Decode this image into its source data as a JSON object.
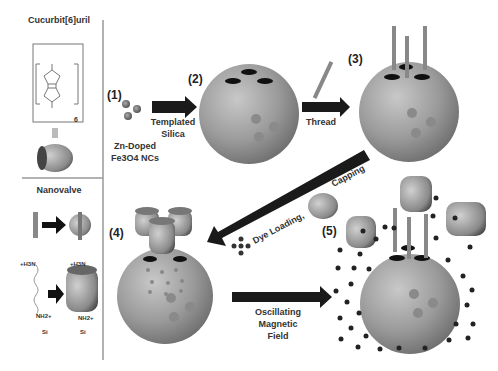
{
  "left_panel": {
    "top_title": "Cucurbit[6]uril",
    "bottom_title": "Nanovalve",
    "struct_subscript": "6",
    "amine_top": "+H3N",
    "amine_bottom": "NH2+",
    "silane": "Si"
  },
  "steps": {
    "s1": "(1)",
    "s2": "(2)",
    "s3": "(3)",
    "s4": "(4)",
    "s5": "(5)"
  },
  "labels": {
    "nc_line1": "Zn-Doped",
    "nc_line2": "Fe3O4 NCs",
    "templated_1": "Templated",
    "templated_2": "Silica",
    "thread": "Thread",
    "capping": "Capping",
    "dye_loading": "Dye Loading,",
    "osc_1": "Oscillating",
    "osc_2": "Magnetic",
    "osc_3": "Field"
  },
  "colors": {
    "sphere": "#9a9a9a",
    "arrow": "#1a1a1a",
    "hole": "#111111",
    "frame": "#888888"
  }
}
